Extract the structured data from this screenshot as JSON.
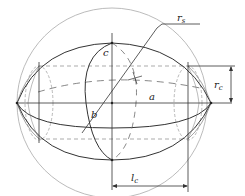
{
  "diagram": {
    "type": "ellipsoid-sphere-cylinder geometry",
    "labels": {
      "r_s": {
        "main": "r",
        "sub": "s"
      },
      "r_c": {
        "main": "r",
        "sub": "c"
      },
      "l_c": {
        "main": "l",
        "sub": "c"
      },
      "a": "a",
      "b": "b",
      "c": "c"
    },
    "colors": {
      "ellipsoid": "#333333",
      "sphere": "#aaaaaa",
      "dashed": "#888888",
      "axis": "#333333"
    }
  }
}
